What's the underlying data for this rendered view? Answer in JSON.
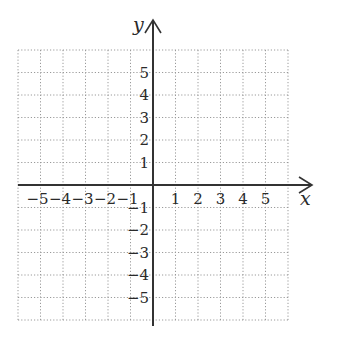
{
  "chart_data": {
    "type": "coordinate-grid",
    "title": "",
    "xlabel": "x",
    "ylabel": "y",
    "xlim": [
      -6,
      6
    ],
    "ylim": [
      -6,
      6
    ],
    "grid": true,
    "grid_style": "dotted",
    "x_ticks": [
      "−5",
      "−4",
      "−3",
      "−2",
      "−1",
      "1",
      "2",
      "3",
      "4",
      "5"
    ],
    "y_ticks": [
      "5",
      "4",
      "3",
      "2",
      "1",
      "−1",
      "−2",
      "−3",
      "−4",
      "−5"
    ],
    "x_tick_values": [
      -5,
      -4,
      -3,
      -2,
      -1,
      1,
      2,
      3,
      4,
      5
    ],
    "y_tick_values": [
      5,
      4,
      3,
      2,
      1,
      -1,
      -2,
      -3,
      -4,
      -5
    ],
    "series": []
  },
  "colors": {
    "axis": "#333333",
    "grid": "#9a9a9a",
    "text": "#2a2a2a"
  }
}
